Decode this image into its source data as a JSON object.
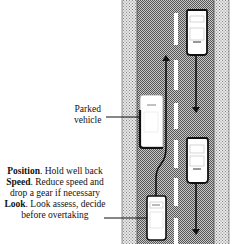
{
  "diagram": {
    "labels": {
      "parked_vehicle_line1": "Parked",
      "parked_vehicle_line2": "vehicle"
    },
    "tips": [
      {
        "keyword": "Position",
        "text": ". Hold well back"
      },
      {
        "keyword": "Speed",
        "text": ". Reduce speed and"
      },
      {
        "keyword": "",
        "text": "drop a gear if necessary"
      },
      {
        "keyword": "Look",
        "text": ". Look assess, decide"
      },
      {
        "keyword": "",
        "text": "before overtaking"
      }
    ],
    "colors": {
      "verge": "#d4d4d4",
      "road": "#9a9a9a",
      "line": "#111111",
      "car": "#ffffff"
    }
  }
}
